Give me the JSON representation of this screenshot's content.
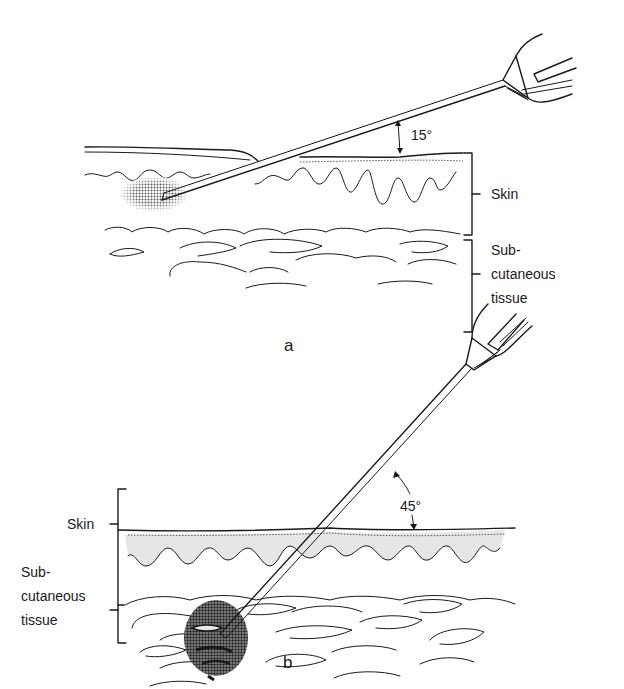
{
  "figure": {
    "panels": [
      {
        "id": "a",
        "panel_label": "a",
        "angle_label": "15°",
        "layers": [
          "Skin",
          "Sub-cutaneous tissue"
        ],
        "labels": {
          "skin": "Skin",
          "sub_line1": "Sub-",
          "sub_line2": "cutaneous",
          "sub_line3": "tissue"
        }
      },
      {
        "id": "b",
        "panel_label": "b",
        "angle_label": "45°",
        "layers": [
          "Skin",
          "Sub-cutaneous tissue"
        ],
        "labels": {
          "skin": "Skin",
          "sub_line1": "Sub-",
          "sub_line2": "cutaneous",
          "sub_line3": "tissue"
        }
      }
    ],
    "colors": {
      "ink": "#1a1a1a",
      "dermis_fill": "#e6e6e6",
      "injection_shade": "#6b6b6b"
    }
  }
}
